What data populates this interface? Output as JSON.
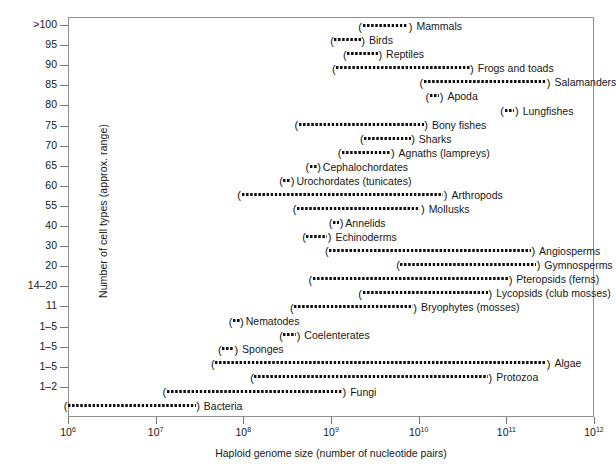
{
  "chart_data": {
    "type": "bar",
    "title": "",
    "xlabel": "Haploid genome size (number of nucleotide pairs)",
    "ylabel": "Number of cell types (approx. range)",
    "xscale": "log",
    "xlim": [
      1000000,
      1000000000000
    ],
    "xticks": [
      {
        "label_mantissa": "10",
        "label_exponent": "6",
        "value": 1000000
      },
      {
        "label_mantissa": "10",
        "label_exponent": "7",
        "value": 10000000
      },
      {
        "label_mantissa": "10",
        "label_exponent": "8",
        "value": 100000000
      },
      {
        "label_mantissa": "10",
        "label_exponent": "9",
        "value": 1000000000
      },
      {
        "label_mantissa": "10",
        "label_exponent": "10",
        "value": 10000000000
      },
      {
        "label_mantissa": "10",
        "label_exponent": "11",
        "value": 100000000000
      },
      {
        "label_mantissa": "10",
        "label_exponent": "12",
        "value": 1000000000000
      }
    ],
    "yticks": [
      ">100",
      "95",
      "90",
      "85",
      "80",
      "75",
      "70",
      "65",
      "60",
      "55",
      "40",
      "30",
      "20",
      "14–20",
      "11",
      "1–5",
      "1–5",
      "1–5",
      "1–2"
    ],
    "grid": false,
    "legend": "none",
    "rows": [
      {
        "label": "Mammals",
        "celltypes": ">100",
        "x_start": 2400000000.0,
        "x_end": 8000000000.0
      },
      {
        "label": "Birds",
        "celltypes": "95",
        "x_start": 1150000000.0,
        "x_end": 2300000000.0
      },
      {
        "label": "Reptiles",
        "celltypes": "90",
        "x_start": 1600000000.0,
        "x_end": 3600000000.0
      },
      {
        "label": "Frogs and toads",
        "celltypes": "85",
        "x_start": 1200000000.0,
        "x_end": 40000000000.0
      },
      {
        "label": "Salamanders",
        "celltypes": "80",
        "x_start": 12000000000.0,
        "x_end": 300000000000.0
      },
      {
        "label": "Apoda",
        "celltypes": "75",
        "x_start": 14000000000.0,
        "x_end": 18000000000.0
      },
      {
        "label": "Lungfishes",
        "celltypes": "70",
        "x_start": 100000000000.0,
        "x_end": 130000000000.0
      },
      {
        "label": "Bony fishes",
        "celltypes": "65",
        "x_start": 450000000.0,
        "x_end": 12000000000.0
      },
      {
        "label": "Sharks",
        "celltypes": "60",
        "x_start": 2500000000.0,
        "x_end": 8500000000.0
      },
      {
        "label": "Agnaths (lampreys)",
        "celltypes": "55",
        "x_start": 1400000000.0,
        "x_end": 5000000000.0
      },
      {
        "label": "Cephalochordates",
        "celltypes": "40",
        "x_start": 600000000.0,
        "x_end": 720000000.0
      },
      {
        "label": "Urochordates (tunicates)",
        "celltypes": "30",
        "x_start": 300000000.0,
        "x_end": 360000000.0
      },
      {
        "label": "Arthropods",
        "celltypes": "20",
        "x_start": 100000000.0,
        "x_end": 20000000000.0
      },
      {
        "label": "Mollusks",
        "celltypes": "14–20",
        "x_start": 430000000.0,
        "x_end": 11000000000.0
      },
      {
        "label": "Annelids",
        "celltypes": "11",
        "x_start": 1100000000.0,
        "x_end": 1300000000.0
      },
      {
        "label": "Echinoderms",
        "celltypes": "1–5",
        "x_start": 550000000.0,
        "x_end": 950000000.0
      },
      {
        "label": "Angiosperms",
        "celltypes": "1–5",
        "x_start": 1000000000.0,
        "x_end": 200000000000.0
      },
      {
        "label": "Gymnosperms",
        "celltypes": "1–5",
        "x_start": 6500000000.0,
        "x_end": 230000000000.0
      },
      {
        "label": "Pteropsids (ferns)",
        "celltypes": "1–2",
        "x_start": 650000000.0,
        "x_end": 110000000000.0
      },
      {
        "label": "Lycopsids (club mosses)",
        "celltypes": "",
        "x_start": 2400000000.0,
        "x_end": 65000000000.0
      },
      {
        "label": "Bryophytes (mosses)",
        "celltypes": "",
        "x_start": 400000000.0,
        "x_end": 9000000000.0
      },
      {
        "label": "Nematodes",
        "celltypes": "",
        "x_start": 80000000.0,
        "x_end": 95000000.0
      },
      {
        "label": "Coelenterates",
        "celltypes": "",
        "x_start": 300000000.0,
        "x_end": 420000000.0
      },
      {
        "label": "Sponges",
        "celltypes": "",
        "x_start": 60000000.0,
        "x_end": 82000000.0
      },
      {
        "label": "Algae",
        "celltypes": "",
        "x_start": 50000000.0,
        "x_end": 300000000000.0
      },
      {
        "label": "Protozoa",
        "celltypes": "",
        "x_start": 140000000.0,
        "x_end": 65000000000.0
      },
      {
        "label": "Fungi",
        "celltypes": "",
        "x_start": 14000000.0,
        "x_end": 1400000000.0
      },
      {
        "label": "Bacteria",
        "celltypes": "",
        "x_start": 1050000.0,
        "x_end": 30000000.0
      }
    ]
  },
  "axes": {
    "x_title": "Haploid genome size (number of nucleotide pairs)",
    "y_title": "Number of cell types (approx. range)"
  }
}
